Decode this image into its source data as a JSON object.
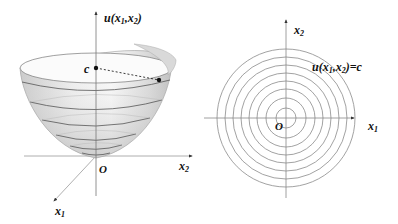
{
  "left_panel": {
    "title": "3D paraboloid surface",
    "axis_vertical_label": "u(x",
    "axis_vertical_sub1": "1",
    "axis_vertical_mid": ",x",
    "axis_vertical_sub2": "2",
    "axis_vertical_end": ")",
    "axis_x2_label": "x",
    "axis_x2_sub": "2",
    "axis_x1_label": "x",
    "axis_x1_sub": "1",
    "origin_label": "O",
    "level_label": "c"
  },
  "right_panel": {
    "title": "Level curves (contour plot)",
    "axis_x2_label": "x",
    "axis_x2_sub": "2",
    "axis_x1_label": "x",
    "axis_x1_sub": "1",
    "origin_label": "O",
    "contour_label_pre": "u(x",
    "contour_label_sub1": "1",
    "contour_label_mid": ",x",
    "contour_label_sub2": "2",
    "contour_label_end": ")=c",
    "ring_count": 8
  },
  "colors": {
    "axis": "#9a9a9a",
    "contour": "#8a8a8a",
    "surface_light": "#f4f4f4",
    "surface_dark": "#b5b5b5",
    "text": "#111111"
  }
}
